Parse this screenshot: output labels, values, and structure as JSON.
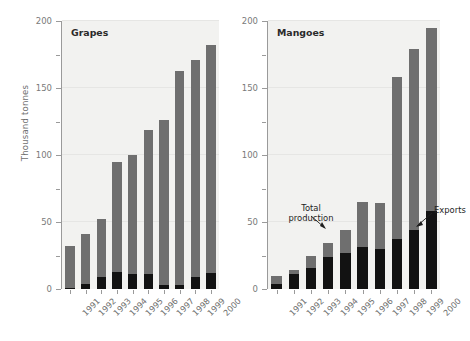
{
  "figure": {
    "ylabel": "Thousand tonnes",
    "colors": {
      "total_production": "#6f6f6f",
      "exports": "#121212",
      "plot_background": "#f2f2f0",
      "axis": "#9a9a9a",
      "gridline": "#e6e6e4",
      "tick_label": "#7a7a7a",
      "title": "#2a2a2a"
    },
    "annotations": {
      "total_production_line1": "Total",
      "total_production_line2": "production",
      "exports": "Exports"
    },
    "y_ticks": [
      "0",
      "50",
      "100",
      "150",
      "200"
    ],
    "y_minor_ticks": [
      "25",
      "75",
      "125",
      "175"
    ]
  },
  "chart_data": [
    {
      "type": "bar",
      "title": "Grapes",
      "xlabel": "",
      "ylabel": "Thousand tonnes",
      "ylim": [
        0,
        200
      ],
      "yticks": [
        0,
        50,
        100,
        150,
        200
      ],
      "grid": true,
      "legend_position": "annotated",
      "categories": [
        "1991",
        "1992",
        "1993",
        "1994",
        "1995",
        "1996",
        "1997",
        "1998",
        "1999",
        "2000"
      ],
      "series": [
        {
          "name": "Total production",
          "values": [
            32,
            41,
            52,
            95,
            100,
            119,
            126,
            163,
            171,
            182
          ]
        },
        {
          "name": "Exports",
          "values": [
            1,
            4,
            9,
            13,
            11,
            11,
            3,
            3,
            9,
            12
          ]
        }
      ]
    },
    {
      "type": "bar",
      "title": "Mangoes",
      "xlabel": "",
      "ylabel": "Thousand tonnes",
      "ylim": [
        0,
        200
      ],
      "yticks": [
        0,
        50,
        100,
        150,
        200
      ],
      "grid": true,
      "legend_position": "annotated",
      "categories": [
        "1991",
        "1992",
        "1993",
        "1994",
        "1995",
        "1996",
        "1997",
        "1998",
        "1999",
        "2000"
      ],
      "series": [
        {
          "name": "Total production",
          "values": [
            10,
            14,
            25,
            34,
            44,
            65,
            64,
            158,
            179,
            195
          ]
        },
        {
          "name": "Exports",
          "values": [
            4,
            11,
            16,
            24,
            27,
            31,
            30,
            37,
            44,
            58
          ]
        }
      ]
    }
  ]
}
